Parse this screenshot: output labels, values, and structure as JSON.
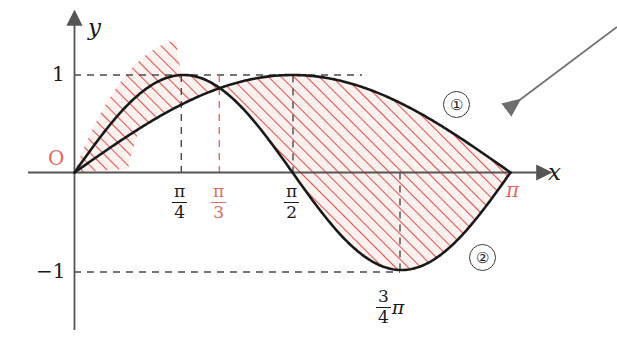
{
  "figure": {
    "axes": {
      "x_axis_label": "x",
      "y_axis_label": "y",
      "origin_label": "O",
      "origin_color": "#e06a64"
    },
    "y_ticks": [
      {
        "label": "1",
        "value": 1
      },
      {
        "label": "−1",
        "value": -1
      }
    ],
    "x_ticks": [
      {
        "num": "π",
        "den": "4",
        "value": 0.7853981634,
        "color": "#1a1a1a",
        "name": "pi-over-4"
      },
      {
        "num": "π",
        "den": "3",
        "value": 1.0471975512,
        "color": "#e06a64",
        "name": "pi-over-3"
      },
      {
        "num": "π",
        "den": "2",
        "value": 1.5707963268,
        "color": "#1a1a1a",
        "name": "pi-over-2"
      },
      {
        "num": "3",
        "den": "4",
        "suffix": "π",
        "value": 2.3561944902,
        "color": "#1a1a1a",
        "name": "three-pi-over-4"
      },
      {
        "label": "π",
        "value": 3.1415926536,
        "color": "#e06a64",
        "name": "pi"
      }
    ],
    "region_labels": [
      {
        "label": "①",
        "name": "region-one"
      },
      {
        "label": "②",
        "name": "region-two"
      }
    ],
    "colors": {
      "curve": "#1a1a1a",
      "hatch": "#d9554f",
      "hatch_fill": "#fdf1ef",
      "axis": "#555555",
      "dashed": "#4a4a4a",
      "accent_red": "#e06a64",
      "annotation_arrow": "#6f6f6f"
    },
    "annotation_arrow": {
      "name": "pointer-arrow",
      "from_x": 617,
      "from_y": 27,
      "to_x": 509,
      "to_y": 108
    },
    "curves": [
      {
        "name": "sin-x",
        "expression": "y = sin x",
        "domain": [
          0,
          3.1415926536
        ],
        "peak_x": 1.5707963268,
        "peak_y": 1
      },
      {
        "name": "sin-2x",
        "expression": "y = sin 2x",
        "domain": [
          0,
          3.1415926536
        ],
        "peak_x": 0.7853981634,
        "peak_y": 1,
        "min_x": 2.3561944902,
        "min_y": -1
      }
    ],
    "intersection": {
      "x": 1.0471975512,
      "label": "π/3"
    }
  }
}
